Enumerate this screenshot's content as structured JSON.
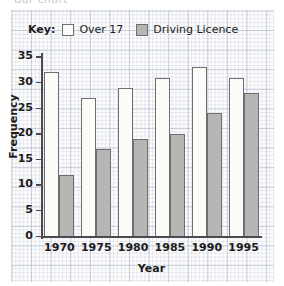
{
  "caption": "Bar chart",
  "legend": {
    "key_label": "Key:",
    "entries": [
      {
        "label": "Over 17",
        "swatch": "white-square-icon",
        "color": "#fbfbf8"
      },
      {
        "label": "Driving Licence",
        "swatch": "grey-square-icon",
        "color": "#b6b6b4"
      }
    ]
  },
  "chart_data": {
    "type": "bar",
    "title": "Bar chart",
    "xlabel": "Year",
    "ylabel": "Frequency",
    "categories": [
      "1970",
      "1975",
      "1980",
      "1985",
      "1990",
      "1995"
    ],
    "series": [
      {
        "name": "Over 17",
        "color": "#fbfbf8",
        "values": [
          32,
          27,
          29,
          31,
          33,
          31
        ]
      },
      {
        "name": "Driving Licence",
        "color": "#b6b6b4",
        "values": [
          12,
          17,
          19,
          20,
          24,
          28
        ]
      }
    ],
    "ylim": [
      0,
      35
    ],
    "ytick_values": [
      0,
      5,
      10,
      15,
      20,
      25,
      30,
      35
    ],
    "ytick_labels": [
      "0",
      "5",
      "10",
      "15",
      "20",
      "25",
      "30",
      "35"
    ],
    "xtick_labels": [
      "1970",
      "1975",
      "1980",
      "1985",
      "1990",
      "1995"
    ],
    "grid": "graph-paper-background",
    "legend_position": "top-left-inside"
  }
}
